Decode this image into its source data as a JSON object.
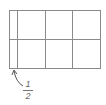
{
  "figure": {
    "grid": {
      "rows": 2,
      "full_columns": 3,
      "partial_columns": 1,
      "line_color": "#8a8a8a"
    },
    "annotation": {
      "label_numerator": "1",
      "label_denominator": "2",
      "points_to": "narrow left column"
    }
  }
}
